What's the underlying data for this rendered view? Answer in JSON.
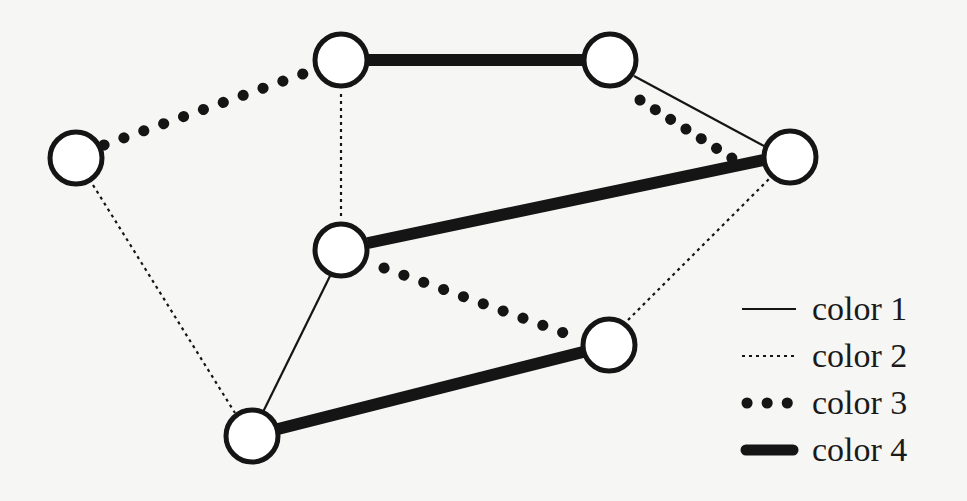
{
  "diagram": {
    "type": "graph-edge-coloring",
    "nodes": [
      {
        "id": "A",
        "x": 76,
        "y": 158
      },
      {
        "id": "B",
        "x": 341,
        "y": 60
      },
      {
        "id": "C",
        "x": 610,
        "y": 60
      },
      {
        "id": "D",
        "x": 790,
        "y": 157
      },
      {
        "id": "E",
        "x": 341,
        "y": 250
      },
      {
        "id": "F",
        "x": 609,
        "y": 345
      },
      {
        "id": "G",
        "x": 252,
        "y": 436
      }
    ],
    "edges": [
      {
        "from": "A",
        "to": "B",
        "color": "color 3"
      },
      {
        "from": "A",
        "to": "G",
        "color": "color 2"
      },
      {
        "from": "B",
        "to": "C",
        "color": "color 4"
      },
      {
        "from": "B",
        "to": "E",
        "color": "color 2"
      },
      {
        "from": "C",
        "to": "D",
        "color": "color 1"
      },
      {
        "from": "C",
        "to": "D",
        "color": "color 3"
      },
      {
        "from": "E",
        "to": "D",
        "color": "color 4"
      },
      {
        "from": "E",
        "to": "F",
        "color": "color 3"
      },
      {
        "from": "E",
        "to": "G",
        "color": "color 1"
      },
      {
        "from": "G",
        "to": "F",
        "color": "color 4"
      },
      {
        "from": "F",
        "to": "D",
        "color": "color 2"
      }
    ]
  },
  "legend": {
    "items": [
      {
        "label": "color 1",
        "style": "thin-solid"
      },
      {
        "label": "color 2",
        "style": "fine-dotted"
      },
      {
        "label": "color 3",
        "style": "bold-dotted"
      },
      {
        "label": "color 4",
        "style": "thick-solid"
      }
    ]
  },
  "colors": {
    "stroke": "#151515",
    "node_fill": "#ffffff",
    "background": "#f6f6f4"
  }
}
